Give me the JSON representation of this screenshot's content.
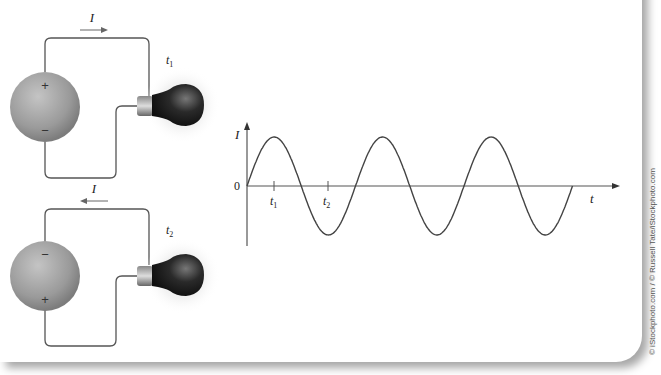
{
  "figure": {
    "credit": "© iStockphoto.com / © Russell Tate/iStockphoto.com",
    "circuit_top": {
      "current_label": "I",
      "current_direction": "right",
      "time_label": "t",
      "time_sub": "1",
      "battery_top_sign": "+",
      "battery_bottom_sign": "−"
    },
    "circuit_bottom": {
      "current_label": "I",
      "current_direction": "left",
      "time_label": "t",
      "time_sub": "2",
      "battery_top_sign": "−",
      "battery_bottom_sign": "+"
    },
    "graph": {
      "y_axis_label": "I",
      "x_axis_label": "t",
      "origin_label": "0",
      "tick1_label": "t",
      "tick1_sub": "1",
      "tick2_label": "t",
      "tick2_sub": "2"
    }
  },
  "chart_data": {
    "type": "line",
    "title": "",
    "xlabel": "t",
    "ylabel": "I",
    "series": [
      {
        "name": "I(t)",
        "function": "sin",
        "cycles": 3,
        "amplitude": 1
      }
    ],
    "annotations": [
      {
        "label": "t1",
        "x_fraction_of_period": 0.25,
        "note": "positive peak; current flows clockwise"
      },
      {
        "label": "t2",
        "x_fraction_of_period": 0.75,
        "note": "negative peak; current reversed"
      }
    ],
    "grid": false
  },
  "colors": {
    "wire": "#555555",
    "battery": "#9a9a9a",
    "bulb": "#1a1a1a",
    "shadow": "#b5b5b5"
  }
}
